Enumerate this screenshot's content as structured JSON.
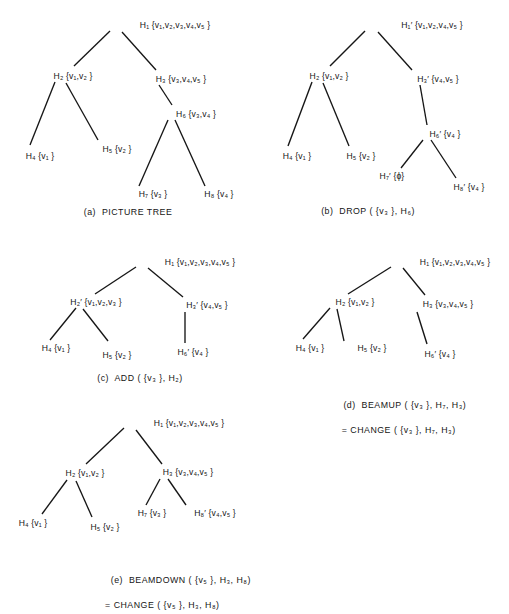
{
  "figure": {
    "ink_color": "#151515",
    "background": "#ffffff"
  },
  "panels": [
    {
      "id": "a",
      "caption_line1": "(a)  PICTURE TREE",
      "caption_line2": "",
      "nodes": [
        {
          "name": "H1",
          "label": "H₁ {v₁,v₂,v₃,v₄,v₅ }"
        },
        {
          "name": "H2",
          "label": "H₂ {v₁,v₂ }"
        },
        {
          "name": "H3",
          "label": "H₃ {v₃,v₄,v₅ }"
        },
        {
          "name": "H6",
          "label": "H₆ {v₃,v₄ }"
        },
        {
          "name": "H4",
          "label": "H₄ {v₁ }"
        },
        {
          "name": "H5",
          "label": "H₅ {v₂ }"
        },
        {
          "name": "H7",
          "label": "H₇ {v₃ }"
        },
        {
          "name": "H8",
          "label": "H₈ {v₄ }"
        }
      ]
    },
    {
      "id": "b",
      "caption_line1": "(b)  DROP ( {v₃ }, H₆)",
      "caption_line2": "",
      "nodes": [
        {
          "name": "H1p",
          "label": "H₁′ {v₁,v₂,v₄,v₅ }"
        },
        {
          "name": "H2",
          "label": "H₂ {v₁,v₂ }"
        },
        {
          "name": "H3p",
          "label": "H₃′ {v₄,v₅ }"
        },
        {
          "name": "H6p",
          "label": "H₆′ {v₄ }"
        },
        {
          "name": "H4",
          "label": "H₄ {v₁ }"
        },
        {
          "name": "H5",
          "label": "H₅ {v₂ }"
        },
        {
          "name": "H7p",
          "label": "H₇′ {ϕ}"
        },
        {
          "name": "H8p",
          "label": "H₈′ {v₄ }"
        }
      ]
    },
    {
      "id": "c",
      "caption_line1": "(c)  ADD ( {v₃ }, H₂)",
      "caption_line2": "",
      "nodes": [
        {
          "name": "H1",
          "label": "H₁ {v₁,v₂,v₃,v₄,v₅ }"
        },
        {
          "name": "H2p",
          "label": "H₂′ {v₁,v₂,v₃ }"
        },
        {
          "name": "H3p",
          "label": "H₃′ {v₄,v₅ }"
        },
        {
          "name": "H4",
          "label": "H₄ {v₁ }"
        },
        {
          "name": "H5",
          "label": "H₅ {v₂ }"
        },
        {
          "name": "H6p",
          "label": "H₆′ {v₄ }"
        }
      ]
    },
    {
      "id": "d",
      "caption_line1": "(d)  BEAMUP ( {v₃ }, H₇, H₃)",
      "caption_line2": "= CHANGE ( {v₃ }, H₇, H₃)",
      "nodes": [
        {
          "name": "H1",
          "label": "H₁ {v₁,v₂,v₃,v₄,v₅ }"
        },
        {
          "name": "H2",
          "label": "H₂ {v₁,v₂ }"
        },
        {
          "name": "H3",
          "label": "H₃ {v₃,v₄,v₅ }"
        },
        {
          "name": "H4",
          "label": "H₄ {v₁ }"
        },
        {
          "name": "H5",
          "label": "H₅ {v₂ }"
        },
        {
          "name": "H6p",
          "label": "H₆′ {v₄ }"
        }
      ]
    },
    {
      "id": "e",
      "caption_line1": "(e)  BEAMDOWN ( {v₅ }, H₃, H₈)",
      "caption_line2": "= CHANGE ( {v₅ }, H₃, H₈)",
      "nodes": [
        {
          "name": "H1",
          "label": "H₁ {v₁,v₂,v₃,v₄,v₅ }"
        },
        {
          "name": "H2",
          "label": "H₂ {v₁,v₂ }"
        },
        {
          "name": "H3",
          "label": "H₃ {v₃,v₄,v₅ }"
        },
        {
          "name": "H4",
          "label": "H₄ {v₁ }"
        },
        {
          "name": "H5",
          "label": "H₅ {v₂ }"
        },
        {
          "name": "H7",
          "label": "H₇ {v₃ }"
        },
        {
          "name": "H8p",
          "label": "H₈′ {v₄,v₅ }"
        }
      ]
    }
  ]
}
